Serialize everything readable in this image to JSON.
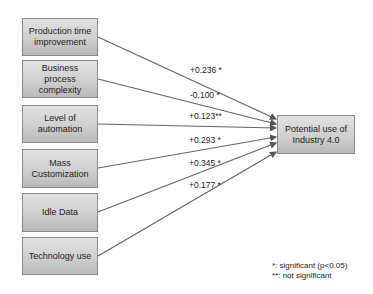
{
  "diagram": {
    "predictors": [
      {
        "label": "Production time improvement",
        "coef": "+0.236 *"
      },
      {
        "label": "Business process complexity",
        "coef": "-0.100 *"
      },
      {
        "label": "Level of automation",
        "coef": "+0.123**"
      },
      {
        "label": "Mass Customization",
        "coef": "+0.293 *"
      },
      {
        "label": "Idle Data",
        "coef": "+0.345 *"
      },
      {
        "label": "Technology use",
        "coef": "+0.177 *"
      }
    ],
    "outcome": {
      "label": "Potential use of Industry 4.0"
    },
    "legend": {
      "line1": "*: significant (p<0.05)",
      "line2": "**: not significant"
    },
    "colors": {
      "box_border": "#8a8a8a",
      "line": "#555555",
      "box_fill_top": "#e2e2e2",
      "box_fill_bottom": "#b9b9b9"
    }
  }
}
